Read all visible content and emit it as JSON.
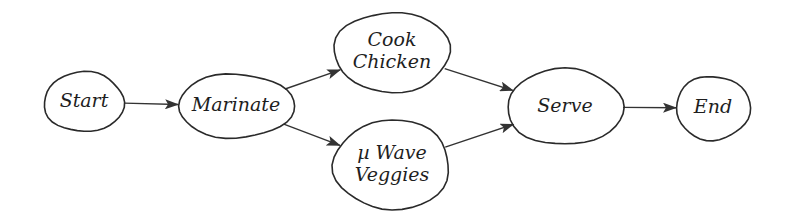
{
  "diagram": {
    "type": "flowchart",
    "style": "hand-drawn",
    "colors": {
      "stroke": "#2a2a2a",
      "text": "#1e1e1e",
      "background": "#ffffff"
    },
    "nodes": [
      {
        "id": "start",
        "label_lines": [
          "Start"
        ],
        "cx": 84,
        "cy": 102,
        "rx": 40,
        "ry": 30
      },
      {
        "id": "marinate",
        "label_lines": [
          "Marinate"
        ],
        "cx": 236,
        "cy": 106,
        "rx": 58,
        "ry": 32
      },
      {
        "id": "cook-chicken",
        "label_lines": [
          "Cook",
          "Chicken"
        ],
        "cx": 392,
        "cy": 52,
        "rx": 58,
        "ry": 40
      },
      {
        "id": "uwave-veggies",
        "label_lines": [
          "µ Wave",
          "Veggies"
        ],
        "cx": 392,
        "cy": 165,
        "rx": 58,
        "ry": 45
      },
      {
        "id": "serve",
        "label_lines": [
          "Serve"
        ],
        "cx": 565,
        "cy": 107,
        "rx": 58,
        "ry": 38
      },
      {
        "id": "end",
        "label_lines": [
          "End"
        ],
        "cx": 713,
        "cy": 108,
        "rx": 37,
        "ry": 32
      }
    ],
    "edges": [
      {
        "from": "start",
        "to": "marinate"
      },
      {
        "from": "marinate",
        "to": "cook-chicken"
      },
      {
        "from": "marinate",
        "to": "uwave-veggies"
      },
      {
        "from": "cook-chicken",
        "to": "serve"
      },
      {
        "from": "uwave-veggies",
        "to": "serve"
      },
      {
        "from": "serve",
        "to": "end"
      }
    ]
  }
}
